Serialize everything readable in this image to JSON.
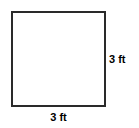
{
  "diagram": {
    "type": "square",
    "shape_name": "square",
    "stroke_color": "#2a2a2a",
    "fill_color": "#ffffff",
    "background_color": "#ffffff",
    "text_color": "#000000",
    "labels": {
      "right_side": "3 ft",
      "bottom_side": "3 ft"
    }
  }
}
